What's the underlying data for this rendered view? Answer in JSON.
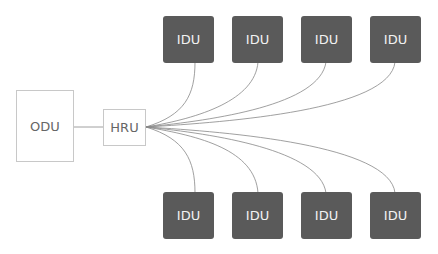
{
  "diagram": {
    "type": "topology",
    "nodes": {
      "odu": {
        "label": "ODU"
      },
      "hru": {
        "label": "HRU"
      },
      "idu_top": [
        {
          "label": "IDU"
        },
        {
          "label": "IDU"
        },
        {
          "label": "IDU"
        },
        {
          "label": "IDU"
        }
      ],
      "idu_bottom": [
        {
          "label": "IDU"
        },
        {
          "label": "IDU"
        },
        {
          "label": "IDU"
        },
        {
          "label": "IDU"
        }
      ]
    },
    "edges": [
      [
        "ODU",
        "HRU"
      ],
      [
        "HRU",
        "IDU top 1"
      ],
      [
        "HRU",
        "IDU top 2"
      ],
      [
        "HRU",
        "IDU top 3"
      ],
      [
        "HRU",
        "IDU top 4"
      ],
      [
        "HRU",
        "IDU bottom 1"
      ],
      [
        "HRU",
        "IDU bottom 2"
      ],
      [
        "HRU",
        "IDU bottom 3"
      ],
      [
        "HRU",
        "IDU bottom 4"
      ]
    ],
    "colors": {
      "idu_fill": "#5a5a5a",
      "idu_text": "#f2f2f2",
      "light_border": "#c8c8c8",
      "line": "#888888"
    }
  }
}
